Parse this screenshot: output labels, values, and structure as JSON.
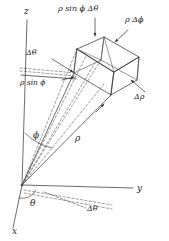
{
  "figure": {
    "background_color": "#ffffff",
    "line_color": "#2b2b2b",
    "dashed_color": "#5a5a5a",
    "width": 169,
    "height": 241
  },
  "axes": {
    "z_label": "z",
    "y_label": "y",
    "x_label": "x",
    "origin": [
      22,
      185
    ]
  },
  "labels": {
    "rho_sin_phi_dtheta": "ρ sin ϕ Δθ",
    "rho_dphi": "ρ Δϕ",
    "drho": "Δρ",
    "dtheta_upper": "Δθ",
    "rho_sin_phi": "ρ sin ϕ",
    "phi": "ϕ",
    "rho": "ρ",
    "theta": "θ",
    "dtheta_lower": "Δθ"
  }
}
